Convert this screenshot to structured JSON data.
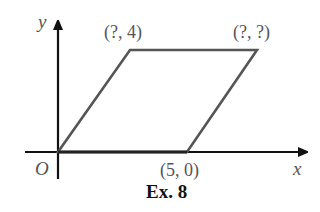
{
  "figure": {
    "caption": "Ex. 8",
    "axes": {
      "x_label": "x",
      "y_label": "y",
      "origin_label": "O"
    },
    "vertices": [
      {
        "name": "origin",
        "label": "",
        "coords": [
          0,
          0
        ]
      },
      {
        "name": "bottom-right",
        "label": "(5, 0)",
        "coords": [
          5,
          0
        ]
      },
      {
        "name": "top-right",
        "label": "(?, ?)",
        "coords": [
          "?",
          "?"
        ]
      },
      {
        "name": "top-left",
        "label": "(?, 4)",
        "coords": [
          "?",
          4
        ]
      }
    ],
    "shape": "parallelogram",
    "colors": {
      "axis": "#111111",
      "shape": "#555555",
      "text": "#555555"
    }
  }
}
